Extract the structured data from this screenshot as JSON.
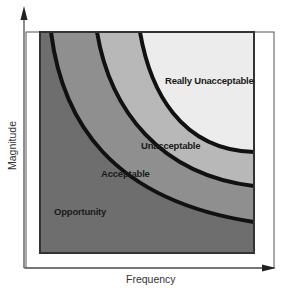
{
  "diagram": {
    "type": "risk-zone-diagram",
    "axes": {
      "x_label": "Frequency",
      "y_label": "Magnitude"
    },
    "zones": [
      {
        "name": "Opportunity",
        "label": "Opportunity",
        "color": "#6e6e6e"
      },
      {
        "name": "Acceptable",
        "label": "Acceptable",
        "color": "#8f8f8f"
      },
      {
        "name": "Unacceptable",
        "label": "Unacceptable",
        "color": "#b8b8b8"
      },
      {
        "name": "Really Unacceptable",
        "label": "Really Unacceptable",
        "color": "#ececec"
      }
    ],
    "boundary_color": "#111111",
    "frame_color": "#444444"
  }
}
